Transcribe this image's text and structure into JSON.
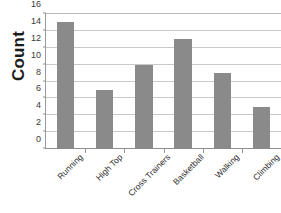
{
  "chart_data": {
    "type": "bar",
    "title": "",
    "xlabel": "",
    "ylabel": "Count",
    "categories": [
      "Running",
      "High Top",
      "Cross Trainers",
      "Basketball",
      "Walking",
      "Climbing"
    ],
    "values": [
      15,
      7,
      10,
      13,
      9,
      5
    ],
    "ylim": [
      0,
      16
    ],
    "yticks": [
      0,
      2,
      4,
      6,
      8,
      10,
      12,
      14,
      16
    ],
    "ytick_labels": [
      "0",
      "2",
      "4",
      "6",
      "8",
      "10",
      "12",
      "14",
      "16"
    ],
    "grid": true,
    "grid_axis": "y",
    "legend": false,
    "legend_position": "none",
    "bar_color": "#8a8a8a",
    "gridline_color": "#c9c9c9",
    "axis_color": "#8f8f8f",
    "background_color": "#ffffff",
    "xtick_label_rotation": -45
  }
}
